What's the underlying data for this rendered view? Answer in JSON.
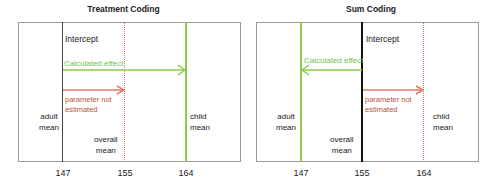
{
  "panels": [
    {
      "title": "Treatment Coding",
      "labels": {
        "intercept": "Intercept",
        "calculated_effect": "Calculated effect",
        "parameter_not_estimated_line1": "parameter not",
        "parameter_not_estimated_line2": "estimated",
        "adult_line1": "adult",
        "adult_line2": "mean",
        "child_line1": "child",
        "child_line2": "mean",
        "overall_line1": "overall",
        "overall_line2": "mean"
      },
      "ticks": [
        "147",
        "155",
        "164"
      ]
    },
    {
      "title": "Sum Coding",
      "labels": {
        "intercept": "Intercept",
        "calculated_effect": "Calculated effect",
        "parameter_not_estimated_line1": "parameter not",
        "parameter_not_estimated_line2": "estimated",
        "adult_line1": "adult",
        "adult_line2": "mean",
        "child_line1": "child",
        "child_line2": "mean",
        "overall_line1": "overall",
        "overall_line2": "mean"
      },
      "ticks": [
        "147",
        "155",
        "164"
      ]
    }
  ],
  "colors": {
    "calculated_effect": "#8ccc4a",
    "parameter_not_estimated": "#e07a6a",
    "intercept": "#111111"
  }
}
